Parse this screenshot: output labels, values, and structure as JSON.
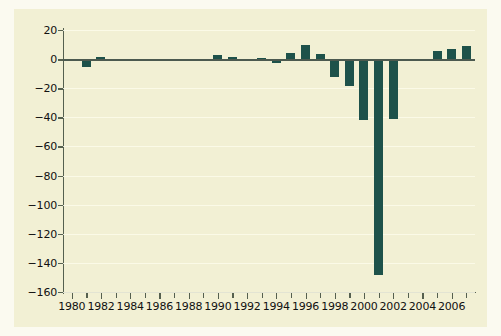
{
  "chart": {
    "background_color": "#f2f0d4",
    "page_color": "#fbfaf0",
    "bar_color": "#1e524a",
    "axis_color": "#55604f",
    "gridline_color": "#fdfcea"
  },
  "chart_data": {
    "type": "bar",
    "title": "",
    "subtitle": "",
    "xlabel": "",
    "ylabel": "",
    "xlim": [
      1979.4,
      2007.6
    ],
    "ylim": [
      -160,
      20
    ],
    "yticks": [
      20,
      0,
      -20,
      -40,
      -60,
      -80,
      -100,
      -120,
      -140,
      -160
    ],
    "ytick_labels": [
      "20",
      "0",
      "-20",
      "-40",
      "-60",
      "-80",
      "-100",
      "-120",
      "-140",
      "-160"
    ],
    "xticks": [
      1980,
      1981,
      1982,
      1983,
      1984,
      1985,
      1986,
      1987,
      1988,
      1989,
      1990,
      1991,
      1992,
      1993,
      1994,
      1995,
      1996,
      1997,
      1998,
      1999,
      2000,
      2001,
      2002,
      2003,
      2004,
      2005,
      2006,
      2007
    ],
    "xtick_labels_shown": [
      "1980",
      "1982",
      "1984",
      "1986",
      "1988",
      "1990",
      "1992",
      "1994",
      "1996",
      "1998",
      "2000",
      "2002",
      "2004",
      "2006"
    ],
    "grid": true,
    "grid_axis": "y",
    "legend": null,
    "legend_position": "none",
    "categories": [
      1980,
      1981,
      1982,
      1983,
      1984,
      1985,
      1986,
      1987,
      1988,
      1989,
      1990,
      1991,
      1992,
      1993,
      1994,
      1995,
      1996,
      1997,
      1998,
      1999,
      2000,
      2001,
      2002,
      2003,
      2004,
      2005,
      2006,
      2007
    ],
    "values": [
      -1.5,
      -5.5,
      1.5,
      0,
      0,
      0,
      0,
      0,
      -0.8,
      -0.5,
      2.5,
      1.5,
      -1.5,
      1.0,
      -2.5,
      4.0,
      9.5,
      3.5,
      -12.0,
      -18.5,
      -42.0,
      -148.0,
      -41.0,
      -1.0,
      -1.0,
      5.5,
      7.0,
      9.0
    ],
    "series": [
      {
        "name": "",
        "values": [
          -1.5,
          -5.5,
          1.5,
          0,
          0,
          0,
          0,
          0,
          -0.8,
          -0.5,
          2.5,
          1.5,
          -1.5,
          1.0,
          -2.5,
          4.0,
          9.5,
          3.5,
          -12.0,
          -18.5,
          -42.0,
          -148.0,
          -41.0,
          -1.0,
          -1.0,
          5.5,
          7.0,
          9.0
        ]
      }
    ],
    "annotations": []
  }
}
